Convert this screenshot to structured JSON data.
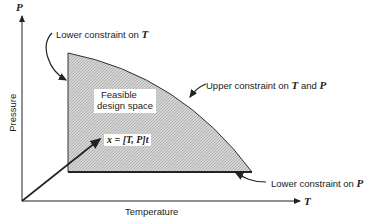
{
  "axes": {
    "y_symbol": "P",
    "y_label": "Pressure",
    "x_symbol": "T",
    "x_label": "Temperature"
  },
  "region": {
    "label_line1": "Feasible",
    "label_line2": "design space",
    "fill": "#c8c8c8"
  },
  "annotations": {
    "lower_T_text": "Lower constraint on ",
    "lower_T_sym": "T",
    "upper_text": "Upper constraint on ",
    "upper_sym1": "T",
    "upper_and": " and ",
    "upper_sym2": "P",
    "lower_P_text": "Lower constraint on ",
    "lower_P_sym": "P",
    "vector_label": "x = [T, P]t"
  }
}
